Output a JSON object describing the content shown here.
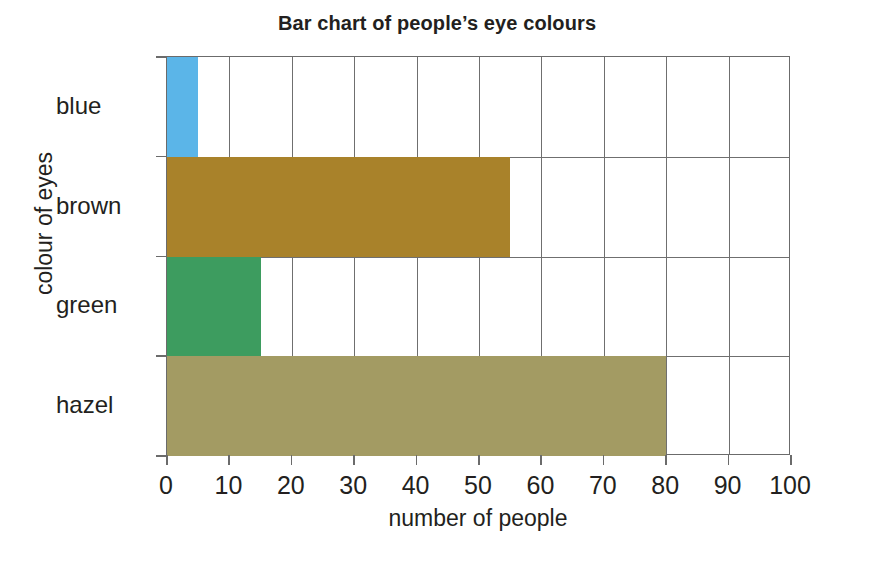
{
  "chart_data": {
    "type": "bar",
    "orientation": "horizontal",
    "title": "Bar chart of people’s eye colours",
    "xlabel": "number of people",
    "ylabel": "colour of eyes",
    "categories": [
      "blue",
      "brown",
      "green",
      "hazel"
    ],
    "values": [
      5,
      55,
      15,
      80
    ],
    "bar_colors": [
      "#5BB5E8",
      "#A9822A",
      "#3D9C5F",
      "#A39B63"
    ],
    "xlim": [
      0,
      100
    ],
    "xticks": [
      0,
      10,
      20,
      30,
      40,
      50,
      60,
      70,
      80,
      90,
      100
    ],
    "xtick_labels": [
      "0",
      "10",
      "20",
      "30",
      "40",
      "50",
      "60",
      "70",
      "80",
      "90",
      "100"
    ],
    "grid": "vertical-and-category-separators",
    "legend": "none",
    "bars": [
      {
        "category": "blue",
        "value": 5,
        "color": "#5BB5E8"
      },
      {
        "category": "brown",
        "value": 55,
        "color": "#A9822A"
      },
      {
        "category": "green",
        "value": 15,
        "color": "#3D9C5F"
      },
      {
        "category": "hazel",
        "value": 80,
        "color": "#A39B63"
      }
    ]
  },
  "style": {
    "background": "#ffffff",
    "axis_color": "#6b6b6b",
    "grid_color": "#6f6f6f",
    "text_color": "#231f20"
  }
}
